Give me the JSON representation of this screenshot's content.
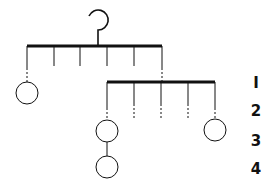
{
  "diagram": {
    "type": "mobile-hanger-tree",
    "level_labels": [
      "I",
      "2",
      "3",
      "4"
    ],
    "colors": {
      "stroke": "#111111",
      "background": "#ffffff"
    },
    "bars": [
      {
        "id": "bar-top",
        "hooks": 6
      },
      {
        "id": "bar-second",
        "hooks": 5
      }
    ],
    "nodes": [
      {
        "id": "node-left",
        "level": 2
      },
      {
        "id": "node-mid-upper",
        "level": 3
      },
      {
        "id": "node-mid-lower",
        "level": 4
      },
      {
        "id": "node-right",
        "level": 3
      }
    ]
  }
}
